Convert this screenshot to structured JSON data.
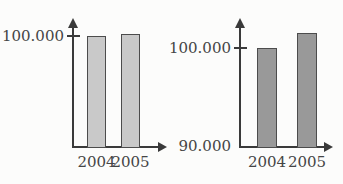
{
  "figure": {
    "kind": "two-bar-charts-same-data-different-y-axis",
    "background": "#fcfcfb"
  },
  "colors": {
    "axis": "#3a3a3a",
    "text": "#454545",
    "bar_border": "#4c4c4c",
    "left_bar_fill": "#c9c9c9",
    "right_bar_fill": "#999999"
  },
  "chart_data": [
    {
      "type": "bar",
      "title": "",
      "xlabel": "",
      "ylabel": "",
      "categories": [
        "2004",
        "2005"
      ],
      "values": [
        100000,
        101500
      ],
      "ylim": [
        0,
        116000
      ],
      "yticks": [
        {
          "label": "100.000",
          "value": 100000
        }
      ],
      "grid": false,
      "legend": false,
      "bar_fill": "#c9c9c9"
    },
    {
      "type": "bar",
      "title": "",
      "xlabel": "",
      "ylabel": "",
      "categories": [
        "2004",
        "2005"
      ],
      "values": [
        100000,
        101500
      ],
      "ylim": [
        90000,
        103000
      ],
      "yticks": [
        {
          "label": "100.000",
          "value": 100000
        },
        {
          "label": "90.000",
          "value": 90000
        }
      ],
      "grid": false,
      "legend": false,
      "bar_fill": "#999999"
    }
  ]
}
